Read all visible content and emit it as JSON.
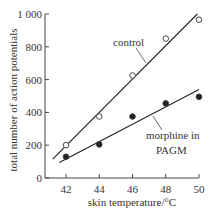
{
  "chart_data": {
    "type": "scatter",
    "title": "",
    "xlabel": "skin temperature/°C",
    "ylabel": "total number of action potentials",
    "xlim": [
      40.8,
      50.2
    ],
    "ylim": [
      0,
      1000
    ],
    "x_ticks": [
      42,
      44,
      46,
      48,
      50
    ],
    "y_ticks": [
      0,
      200,
      400,
      600,
      800,
      1000
    ],
    "x_tick_labels": [
      "42",
      "44",
      "46",
      "48",
      "50"
    ],
    "y_tick_labels": [
      "0",
      "200",
      "400",
      "600",
      "800",
      "1 000"
    ],
    "grid": false,
    "legend": "inline annotations",
    "series": [
      {
        "name": "control",
        "marker": "open-circle",
        "x": [
          42,
          44,
          46,
          48,
          50
        ],
        "values": [
          200,
          375,
          625,
          850,
          965
        ],
        "fit_line": {
          "x": [
            41.2,
            49.9
          ],
          "y": [
            115,
            1000
          ]
        }
      },
      {
        "name": "morphine in PAGM",
        "marker": "filled-circle",
        "x": [
          42,
          44,
          46,
          48,
          50
        ],
        "values": [
          130,
          205,
          375,
          455,
          495
        ],
        "fit_line": {
          "x": [
            41.6,
            50
          ],
          "y": [
            95,
            540
          ]
        }
      }
    ],
    "annotations": [
      {
        "text": "control",
        "target_series": "control"
      },
      {
        "text": "morphine in",
        "target_series": "morphine in PAGM"
      },
      {
        "text": "PAGM",
        "target_series": "morphine in PAGM"
      }
    ]
  }
}
